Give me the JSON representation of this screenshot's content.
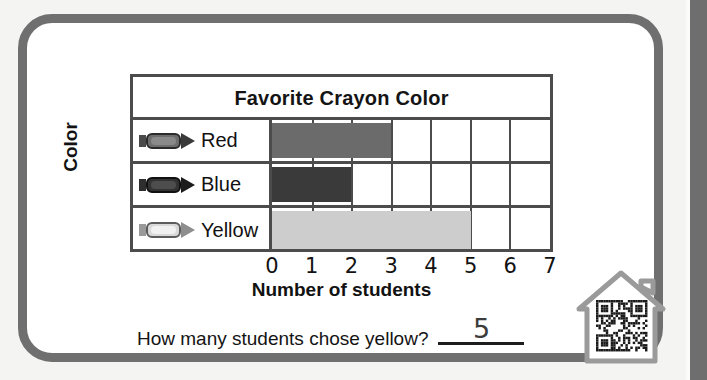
{
  "worksheet": {
    "question_text": "How many students chose yellow?",
    "answer_value": "5"
  },
  "chart_data": {
    "type": "bar",
    "orientation": "horizontal",
    "title": "Favorite Crayon Color",
    "xlabel": "Number of students",
    "ylabel": "Color",
    "categories": [
      "Red",
      "Blue",
      "Yellow"
    ],
    "values": [
      3,
      2,
      5
    ],
    "xlim": [
      0,
      7
    ],
    "xticks": [
      "0",
      "1",
      "2",
      "3",
      "4",
      "5",
      "6",
      "7"
    ],
    "grid": true,
    "legend": "none",
    "bar_colors": [
      "#6b6b6b",
      "#3a3a3a",
      "#cdcdcd"
    ],
    "row_icons": [
      "red-crayon-icon",
      "blue-crayon-icon",
      "yellow-crayon-icon"
    ]
  },
  "graphics": {
    "qr_house_icon": "qr-code-house-icon"
  },
  "colors": {
    "frame": "#6f6f6f",
    "chart_border": "#4c4c4c",
    "bar_red": "#6b6b6b",
    "bar_blue": "#3a3a3a",
    "bar_yellow": "#cdcdcd",
    "page_background": "#f4f4f2"
  }
}
